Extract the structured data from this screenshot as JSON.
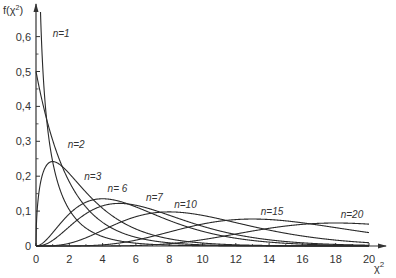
{
  "chart_data": {
    "type": "line",
    "title": "",
    "xlabel": "χ²",
    "ylabel": "f(χ²)",
    "xlim": [
      0,
      20
    ],
    "ylim": [
      0,
      0.65
    ],
    "grid": false,
    "legend_position": "inline labels on curves",
    "x_ticks": [
      0,
      2,
      4,
      6,
      8,
      10,
      12,
      14,
      16,
      18,
      20
    ],
    "x_tick_labels": [
      "0",
      "2",
      "4",
      "6",
      "8",
      "10",
      "12",
      "14",
      "16",
      "18",
      "20"
    ],
    "y_ticks": [
      0,
      0.1,
      0.2,
      0.3,
      0.4,
      0.5,
      0.6
    ],
    "y_tick_labels": [
      "0",
      "0,1",
      "0,2",
      "0,3",
      "0,4",
      "0,5",
      "0,6"
    ],
    "series": [
      {
        "name": "n=1",
        "df": 1,
        "peak": {
          "x": 0,
          "y": "→∞"
        }
      },
      {
        "name": "n=2",
        "df": 2,
        "peak": {
          "x": 0,
          "y": 0.5
        }
      },
      {
        "name": "n=3",
        "df": 3,
        "peak": {
          "x": 1,
          "y": 0.24
        }
      },
      {
        "name": "n=6",
        "df": 6,
        "peak": {
          "x": 4,
          "y": 0.14
        }
      },
      {
        "name": "n=7",
        "df": 7,
        "peak": {
          "x": 5,
          "y": 0.12
        }
      },
      {
        "name": "n=10",
        "df": 10,
        "peak": {
          "x": 8,
          "y": 0.09
        }
      },
      {
        "name": "n=15",
        "df": 15,
        "peak": {
          "x": 13,
          "y": 0.07
        }
      },
      {
        "name": "n=20",
        "df": 20,
        "peak": {
          "x": 18,
          "y": 0.06
        }
      }
    ],
    "annotations": [
      {
        "text": "n=1",
        "x": 1.0,
        "y": 0.6
      },
      {
        "text": "n=2",
        "x": 1.9,
        "y": 0.28
      },
      {
        "text": "n=3",
        "x": 2.9,
        "y": 0.19
      },
      {
        "text": "n= 6",
        "x": 4.3,
        "y": 0.155
      },
      {
        "text": "n=7",
        "x": 6.6,
        "y": 0.13
      },
      {
        "text": "n=10",
        "x": 8.3,
        "y": 0.11
      },
      {
        "text": "n=15",
        "x": 13.5,
        "y": 0.09
      },
      {
        "text": "n=20",
        "x": 18.3,
        "y": 0.08
      }
    ]
  },
  "axes": {
    "y_title": "f(χ",
    "y_title_sup": "2",
    "y_title_close": ")",
    "x_title": "χ",
    "x_title_sup": "2"
  },
  "colors": {
    "line": "#2a2a2a",
    "axis": "#333333",
    "background": "#ffffff"
  }
}
